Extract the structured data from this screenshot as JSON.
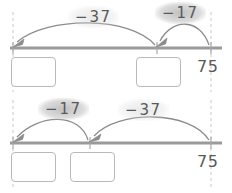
{
  "worksheet": {
    "title": "Number line subtraction diagrams",
    "line_color": "#9a9a9a",
    "arrow_color": "#8c8c8c",
    "box_border_color": "#b9b9b9",
    "text_color": "#58595b",
    "highlight_color": "#b0b0b0",
    "dashed_guide_color": "#c8c8c8"
  },
  "diagrams": [
    {
      "id": "top",
      "name": "first-number-line",
      "start_value": "75",
      "jumps": [
        {
          "label_minus": "−",
          "label_value": "37",
          "highlight": "soft"
        },
        {
          "label_minus": "−",
          "label_value": "17",
          "highlight": "strong"
        }
      ],
      "answer_boxes": [
        {
          "name": "answer-box-1",
          "value": ""
        },
        {
          "name": "answer-box-2",
          "value": ""
        }
      ]
    },
    {
      "id": "bottom",
      "name": "second-number-line",
      "start_value": "75",
      "jumps": [
        {
          "label_minus": "−",
          "label_value": "17",
          "highlight": "strong"
        },
        {
          "label_minus": "−",
          "label_value": "37",
          "highlight": "soft"
        }
      ],
      "answer_boxes": [
        {
          "name": "answer-box-3",
          "value": ""
        },
        {
          "name": "answer-box-4",
          "value": ""
        }
      ]
    }
  ]
}
